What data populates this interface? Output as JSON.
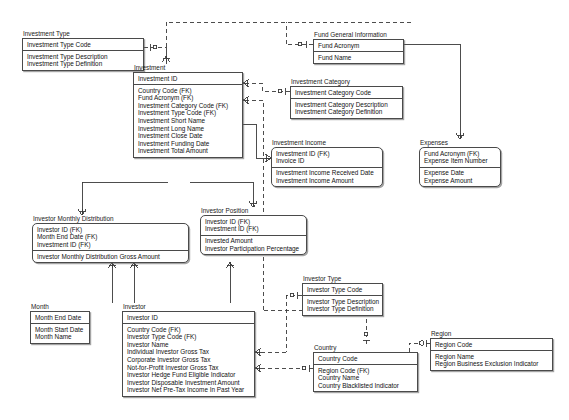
{
  "diagram": {
    "notation": "IE crow's foot",
    "background_color": "#ffffff",
    "line_color": "#4a4a4a",
    "text_color": "#111111"
  },
  "entities": [
    {
      "id": "investment_type",
      "name": "Investment Type",
      "kind": "independent",
      "x": 22,
      "y": 30,
      "w": 122,
      "pk": [
        "Investment Type Code"
      ],
      "attrs": [
        "Investment Type Description",
        "Investment Type Definition"
      ]
    },
    {
      "id": "fund_general_information",
      "name": "Fund General Information",
      "kind": "independent",
      "x": 313,
      "y": 31,
      "w": 91,
      "pk": [
        "Fund Acronym"
      ],
      "attrs": [
        "Fund Name"
      ]
    },
    {
      "id": "investment",
      "name": "Investment",
      "kind": "independent",
      "x": 133,
      "y": 64,
      "w": 110,
      "pk": [
        "Investment ID"
      ],
      "attrs": [
        "Country Code (FK)",
        "Fund Acronym (FK)",
        "Investment Category Code (FK)",
        "Investment Type Code (FK)",
        "Investment Short Name",
        "Investment Long Name",
        "Investment Close Date",
        "Investment Funding Date",
        "Investment Total Amount"
      ]
    },
    {
      "id": "investment_category",
      "name": "Investment Category",
      "kind": "independent",
      "x": 290,
      "y": 78,
      "w": 113,
      "pk": [
        "Investment Category Code"
      ],
      "attrs": [
        "Investment Category Description",
        "Investment Category Definition"
      ]
    },
    {
      "id": "investment_income",
      "name": "Investment Income",
      "kind": "dependent",
      "x": 271,
      "y": 139,
      "w": 112,
      "pk": [
        "Investment ID (FK)",
        "Invoice ID"
      ],
      "attrs": [
        "Investment Income Received Date",
        "Investment Income Amount"
      ]
    },
    {
      "id": "expenses",
      "name": "Expenses",
      "kind": "dependent",
      "x": 419,
      "y": 139,
      "w": 82,
      "pk": [
        "Fund Acronym (FK)",
        "Expense Item Number"
      ],
      "attrs": [
        "Expense Date",
        "Expense Amount"
      ]
    },
    {
      "id": "investor_monthly_distribution",
      "name": "Investor Monthly Distribution",
      "kind": "dependent",
      "x": 32,
      "y": 215,
      "w": 157,
      "pk": [
        "Investor ID (FK)",
        "Month End Date (FK)",
        "Investment ID (FK)"
      ],
      "attrs": [
        "Investor Monthly Distribution Gross Amount"
      ]
    },
    {
      "id": "investor_position",
      "name": "Investor Position",
      "kind": "dependent",
      "x": 200,
      "y": 207,
      "w": 107,
      "pk": [
        "Investor ID (FK)",
        "Investment ID (FK)"
      ],
      "attrs": [
        "Invested Amount",
        "Investor Participation Percentage"
      ]
    },
    {
      "id": "investor_type",
      "name": "Investor Type",
      "kind": "independent",
      "x": 302,
      "y": 275,
      "w": 81,
      "pk": [
        "Investor Type Code"
      ],
      "attrs": [
        "Investor Type Description",
        "Investor Type Definition"
      ]
    },
    {
      "id": "month",
      "name": "Month",
      "kind": "independent",
      "x": 30,
      "y": 303,
      "w": 60,
      "pk": [
        "Month End Date"
      ],
      "attrs": [
        "Month Start Date",
        "Month Name"
      ]
    },
    {
      "id": "investor",
      "name": "Investor",
      "kind": "independent",
      "x": 122,
      "y": 303,
      "w": 133,
      "pk": [
        "Investor ID"
      ],
      "attrs": [
        "Country Code (FK)",
        "Investor Type Code (FK)",
        "Investor Name",
        "Individual Investor Gross Tax",
        "Corporate Investor Gross Tax",
        "Not-for-Profit Investor Gross Tax",
        "Investor Hedge Fund Eligible Indicator",
        "Investor Disposable Investment Amount",
        "Investor Net Pre-Tax Income In Past Year"
      ]
    },
    {
      "id": "country",
      "name": "Country",
      "kind": "independent",
      "x": 313,
      "y": 344,
      "w": 105,
      "pk": [
        "Country Code"
      ],
      "attrs": [
        "Region Code (FK)",
        "Country Name",
        "Country Blacklisted Indicator"
      ]
    },
    {
      "id": "region",
      "name": "Region",
      "kind": "independent",
      "x": 430,
      "y": 330,
      "w": 123,
      "pk": [
        "Region Code"
      ],
      "attrs": [
        "Region Name",
        "Region Business Exclusion Indicator"
      ]
    }
  ],
  "relationships": [
    {
      "from": "investment_type",
      "to": "investment",
      "type": "non-identifying",
      "style": "dashed"
    },
    {
      "from": "fund_general_information",
      "to": "investment",
      "type": "non-identifying",
      "style": "dashed"
    },
    {
      "from": "investment_category",
      "to": "investment",
      "type": "non-identifying",
      "style": "dashed"
    },
    {
      "from": "investment",
      "to": "investment_income",
      "type": "identifying",
      "style": "solid"
    },
    {
      "from": "fund_general_information",
      "to": "expenses",
      "type": "identifying",
      "style": "solid"
    },
    {
      "from": "investment",
      "to": "investor_position",
      "type": "identifying",
      "style": "solid"
    },
    {
      "from": "investment",
      "to": "investor_monthly_distribution",
      "type": "identifying",
      "style": "solid"
    },
    {
      "from": "investor",
      "to": "investor_monthly_distribution",
      "type": "identifying",
      "style": "solid"
    },
    {
      "from": "month",
      "to": "investor_monthly_distribution",
      "type": "identifying",
      "style": "solid"
    },
    {
      "from": "investor",
      "to": "investor_position",
      "type": "identifying",
      "style": "solid"
    },
    {
      "from": "investor_type",
      "to": "investor",
      "type": "non-identifying",
      "style": "dashed"
    },
    {
      "from": "country",
      "to": "investor",
      "type": "non-identifying",
      "style": "dashed"
    },
    {
      "from": "country",
      "to": "investment",
      "type": "non-identifying",
      "style": "dashed"
    },
    {
      "from": "region",
      "to": "country",
      "type": "non-identifying",
      "style": "dashed"
    }
  ]
}
